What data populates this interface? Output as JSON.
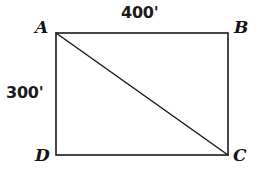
{
  "figure": {
    "kind": "rectangle-with-diagonal",
    "background_color": "#ffffff",
    "stroke_color": "#1a1a1a",
    "label_color": "#151515",
    "rect": {
      "left": 56,
      "top": 33,
      "right": 228,
      "bottom": 155,
      "stroke_width": 1.6
    },
    "diagonal": {
      "from": "A",
      "to": "C",
      "x1": 56,
      "y1": 33,
      "x2": 228,
      "y2": 155,
      "stroke_width": 1.5
    },
    "vertices": [
      {
        "id": "A",
        "label": "A",
        "corner": "top-left"
      },
      {
        "id": "B",
        "label": "B",
        "corner": "top-right"
      },
      {
        "id": "C",
        "label": "C",
        "corner": "bottom-right"
      },
      {
        "id": "D",
        "label": "D",
        "corner": "bottom-left"
      }
    ],
    "dimensions": [
      {
        "id": "top",
        "label": "400'",
        "edge": "AB",
        "value": 400,
        "unit": "feet",
        "position": "above"
      },
      {
        "id": "left",
        "label": "300'",
        "edge": "AD",
        "value": 300,
        "unit": "feet",
        "position": "left"
      }
    ]
  }
}
